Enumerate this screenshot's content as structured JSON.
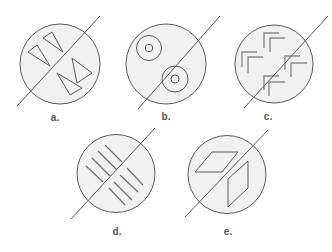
{
  "colors": {
    "background": "#ffffff",
    "circle_fill": "#f1f1f1",
    "stroke": "#5a5a5a",
    "hatch": "#6a6a6a"
  },
  "figures": [
    {
      "id": "a",
      "label": "a.",
      "label_pos": [
        55,
        117
      ],
      "circle": {
        "cx": 60,
        "cy": 64,
        "r": 40
      },
      "divider": [
        17,
        106,
        100,
        16
      ],
      "shapes": [
        {
          "type": "polygon",
          "points": "43,38 52,32 63,52"
        },
        {
          "type": "polygon",
          "points": "28,52 37,45 50,66"
        },
        {
          "type": "polygon",
          "points": "72,58 77,83 92,73"
        },
        {
          "type": "polygon",
          "points": "57,73 70,95 82,88"
        }
      ]
    },
    {
      "id": "b",
      "label": "b.",
      "label_pos": [
        166,
        116
      ],
      "circle": {
        "cx": 166,
        "cy": 64,
        "r": 40
      },
      "divider": [
        138,
        109,
        220,
        16
      ],
      "shapes": [
        {
          "type": "circle",
          "cx": 149,
          "cy": 48,
          "r": 12.5
        },
        {
          "type": "circle",
          "cx": 149,
          "cy": 48,
          "r": 3.7
        },
        {
          "type": "circle",
          "cx": 175,
          "cy": 79,
          "r": 13
        },
        {
          "type": "circle",
          "cx": 175,
          "cy": 79,
          "r": 4
        }
      ]
    },
    {
      "id": "c",
      "label": "c.",
      "label_pos": [
        268,
        116
      ],
      "circle": {
        "cx": 274,
        "cy": 64,
        "r": 39
      },
      "divider": [
        244,
        108,
        328,
        16
      ],
      "shapes": [
        {
          "type": "polyline",
          "points": "264,48 264,33 279,33"
        },
        {
          "type": "polyline",
          "points": "270,52 270,38 285,38"
        },
        {
          "type": "polyline",
          "points": "242,67 242,52 257,52"
        },
        {
          "type": "polyline",
          "points": "248,73 248,57 263,57"
        },
        {
          "type": "polyline",
          "points": "285,70 285,56 300,56"
        },
        {
          "type": "polyline",
          "points": "291,77 291,63 307,63"
        },
        {
          "type": "polyline",
          "points": "264,90 264,76 279,76"
        },
        {
          "type": "polyline",
          "points": "269,96 269,82 285,82"
        }
      ]
    },
    {
      "id": "d",
      "label": "d.",
      "label_pos": [
        117,
        231
      ],
      "circle": {
        "cx": 116,
        "cy": 173.5,
        "r": 39
      },
      "divider": [
        71,
        219,
        155,
        128
      ],
      "shapes": [
        {
          "type": "line",
          "points": [
            105,
            145,
            122,
            162
          ]
        },
        {
          "type": "line",
          "points": [
            98,
            151,
            117,
            170
          ]
        },
        {
          "type": "line",
          "points": [
            92,
            158,
            110,
            176
          ]
        },
        {
          "type": "line",
          "points": [
            86,
            166,
            103,
            182
          ]
        },
        {
          "type": "line",
          "points": [
            127,
            168,
            143,
            185
          ]
        },
        {
          "type": "line",
          "points": [
            120,
            175,
            138,
            192
          ]
        },
        {
          "type": "line",
          "points": [
            114,
            182,
            132,
            200
          ]
        },
        {
          "type": "line",
          "points": [
            109,
            188,
            125,
            205
          ]
        }
      ]
    },
    {
      "id": "e",
      "label": "e.",
      "label_pos": [
        228,
        231
      ],
      "circle": {
        "cx": 227,
        "cy": 174.5,
        "r": 39
      },
      "divider": [
        185,
        217,
        268,
        130
      ],
      "shapes": [
        {
          "type": "polygon",
          "points": "212,152 238,152 222,172 195,172"
        },
        {
          "type": "polygon",
          "points": "248,161 248,188 228,207 228,179"
        }
      ]
    }
  ]
}
